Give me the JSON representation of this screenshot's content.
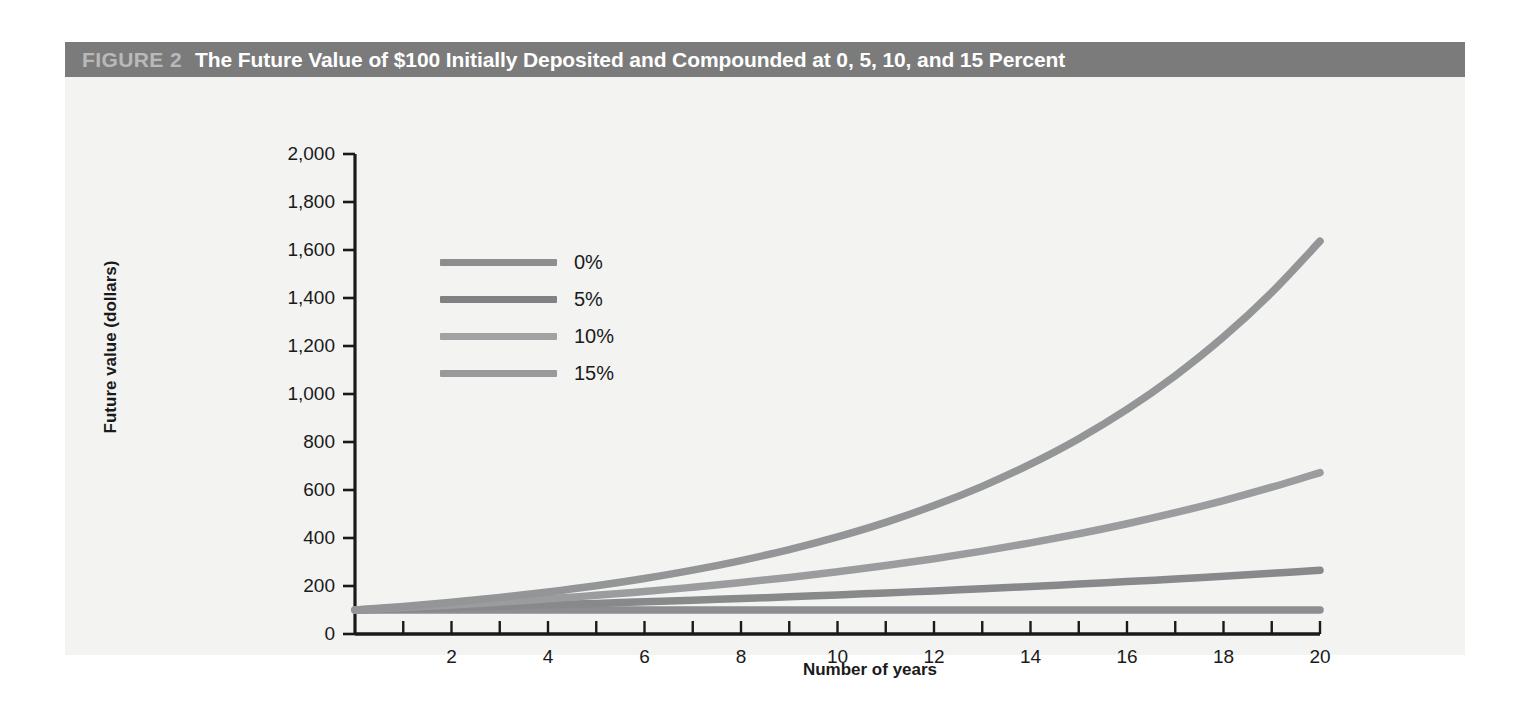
{
  "figure": {
    "number_label": "FIGURE 2",
    "title": "The Future Value of $100 Initially Deposited and Compounded at 0, 5, 10, and 15 Percent",
    "header_bg": "#7b7b7b",
    "panel_bg": "#f2f2f1"
  },
  "chart_data": {
    "type": "line",
    "title": "The Future Value of $100 Initially Deposited and Compounded at 0, 5, 10, and 15 Percent",
    "xlabel": "Number of years",
    "ylabel": "Future value (dollars)",
    "xlim": [
      0,
      20
    ],
    "ylim": [
      0,
      2000
    ],
    "grid": false,
    "legend_position": "upper-left-inside",
    "x": [
      0,
      1,
      2,
      3,
      4,
      5,
      6,
      7,
      8,
      9,
      10,
      11,
      12,
      13,
      14,
      15,
      16,
      17,
      18,
      19,
      20
    ],
    "x_ticks": [
      2,
      4,
      6,
      8,
      10,
      12,
      14,
      16,
      18,
      20
    ],
    "x_tick_labels": [
      "2",
      "4",
      "6",
      "8",
      "10",
      "12",
      "14",
      "16",
      "18",
      "20"
    ],
    "x_minor_ticks": [
      1,
      2,
      3,
      4,
      5,
      6,
      7,
      8,
      9,
      10,
      11,
      12,
      13,
      14,
      15,
      16,
      17,
      18,
      19,
      20
    ],
    "y_ticks": [
      0,
      200,
      400,
      600,
      800,
      1000,
      1200,
      1400,
      1600,
      1800,
      2000
    ],
    "y_tick_labels": [
      "0",
      "200",
      "400",
      "600",
      "800",
      "1,000",
      "1,200",
      "1,400",
      "1,600",
      "1,800",
      "2,000"
    ],
    "series": [
      {
        "name": "0%",
        "rate": 0,
        "color": "#8c8e90",
        "values": [
          100,
          100,
          100,
          100,
          100,
          100,
          100,
          100,
          100,
          100,
          100,
          100,
          100,
          100,
          100,
          100,
          100,
          100,
          100,
          100,
          100
        ]
      },
      {
        "name": "5%",
        "rate": 5,
        "color": "#87898b",
        "values": [
          100,
          105,
          110.3,
          115.8,
          121.6,
          127.6,
          134,
          140.7,
          147.7,
          155.1,
          162.9,
          171,
          179.6,
          188.6,
          198,
          207.9,
          218.3,
          229.2,
          240.7,
          252.7,
          265.3
        ]
      },
      {
        "name": "10%",
        "rate": 10,
        "color": "#9a9c9e",
        "values": [
          100,
          110,
          121,
          133.1,
          146.4,
          161.1,
          177.2,
          194.9,
          214.4,
          235.8,
          259.4,
          285.3,
          313.8,
          345.2,
          379.7,
          417.7,
          459.5,
          505.4,
          556,
          611.6,
          672.7
        ]
      },
      {
        "name": "15%",
        "rate": 15,
        "color": "#939597",
        "values": [
          100,
          115,
          132.3,
          152.1,
          174.9,
          201.1,
          231.3,
          266,
          306,
          351.8,
          404.6,
          465.2,
          535,
          615.3,
          707.6,
          813.7,
          935.8,
          1076.3,
          1237.7,
          1423.2,
          1636.7
        ]
      }
    ]
  },
  "legend": {
    "items": [
      {
        "label": "0%",
        "color": "#8c8e90"
      },
      {
        "label": "5%",
        "color": "#7f8183"
      },
      {
        "label": "10%",
        "color": "#a0a2a4"
      },
      {
        "label": "15%",
        "color": "#97999b"
      }
    ]
  },
  "axes": {
    "axis_color": "#1a1a1a"
  }
}
